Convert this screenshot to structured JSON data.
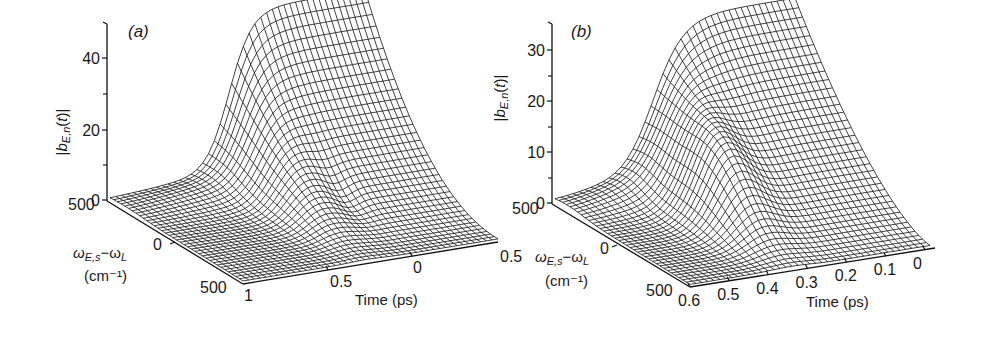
{
  "chart_data": [
    {
      "type": "surface3d",
      "panel": "(a)",
      "zlabel": "|b_{E,n}(t)|",
      "ylabel": "ωE,s−ωL (cm⁻¹)",
      "xlabel": "Time (ps)",
      "z_ticks": [
        "0",
        "20",
        "40"
      ],
      "z_minor_ticks": [
        10,
        30
      ],
      "zlim": [
        0,
        50
      ],
      "freq_ticks": [
        "500",
        "0",
        "500"
      ],
      "freq_range": [
        -500,
        500
      ],
      "time_ticks": [
        "1",
        "0.5",
        "0",
        "0.5"
      ],
      "time_range": [
        1,
        -0.5
      ],
      "description": "Wireframe surface; near-zero plateau with a small ridge near freq=0, a sharp rise around time≈0.2 ps to a plateau of ≈47 at the far (positive frequency) edge, ripple behind the rise near time 0",
      "peak_value": 47,
      "small_ridge_value": 3
    },
    {
      "type": "surface3d",
      "panel": "(b)",
      "zlabel": "|b_{E,n}(t)|",
      "ylabel": "ωE,s−ωL (cm⁻¹)",
      "xlabel": "Time (ps)",
      "z_ticks": [
        "0",
        "10",
        "20",
        "30"
      ],
      "z_minor_ticks": [
        5,
        15,
        25
      ],
      "zlim": [
        0,
        35
      ],
      "freq_ticks": [
        "500",
        "0",
        "500"
      ],
      "freq_range": [
        -500,
        500
      ],
      "time_ticks": [
        "0.6",
        "0.5",
        "0.4",
        "0.3",
        "0.2",
        "0.1",
        "0"
      ],
      "time_range": [
        0.6,
        0
      ],
      "description": "Wireframe surface; broad Gaussian-like rise around time≈0.35 ps to a flat plateau ≈31 extending toward time 0 at the far edge; small ridge near freq 0 on the left",
      "peak_value": 31,
      "small_ridge_value": 3
    }
  ],
  "panels": {
    "a": {
      "label": "(a)",
      "z_ticks": [
        {
          "v": "0",
          "y": 200
        },
        {
          "v": "20",
          "y": 130
        },
        {
          "v": "40",
          "y": 58
        }
      ],
      "freq_ticks": [
        "500",
        "0",
        "500"
      ],
      "time_ticks": [
        "1",
        "0.5",
        "0",
        "0.5"
      ],
      "freq_label_1": "ωE,s−ωL",
      "freq_label_2": "(cm⁻¹)",
      "time_label": "Time (ps)",
      "z_label": "|bE,n(t)|"
    },
    "b": {
      "label": "(b)",
      "z_ticks": [
        {
          "v": "0",
          "y": 203
        },
        {
          "v": "10",
          "y": 152
        },
        {
          "v": "20",
          "y": 101
        },
        {
          "v": "30",
          "y": 50
        }
      ],
      "freq_ticks": [
        "500",
        "0",
        "500"
      ],
      "time_ticks": [
        "0.6",
        "0.5",
        "0.4",
        "0.3",
        "0.2",
        "0.1",
        "0"
      ],
      "freq_label_1": "ωE,s−ωL",
      "freq_label_2": "(cm⁻¹)",
      "time_label": "Time (ps)",
      "z_label": "|bE,n(t)|"
    }
  }
}
